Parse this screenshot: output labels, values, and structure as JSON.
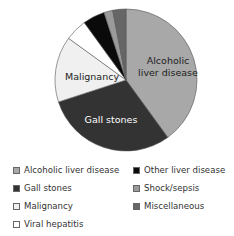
{
  "chart_data": {
    "type": "pie",
    "title": "",
    "categories": [
      "Alcoholic liver disease",
      "Gall stones",
      "Malignancy",
      "Viral hepatitis",
      "Other liver disease",
      "Shock/sepsis",
      "Miscellaneous"
    ],
    "values": [
      40,
      30,
      15,
      5,
      5,
      2,
      3
    ],
    "unit": "percent (estimated)",
    "colors": [
      "#a8a8a8",
      "#333333",
      "#f0f0f0",
      "#ffffff",
      "#0a0a0a",
      "#9a9a9a",
      "#666666"
    ],
    "slice_labels": {
      "Alcoholic liver disease": [
        "Alcoholic",
        "liver disease"
      ],
      "Gall stones": [
        "Gall stones"
      ],
      "Malignancy": [
        "Malignancy"
      ]
    },
    "start_angle_deg": 0,
    "direction": "clockwise",
    "legend_position": "bottom",
    "legend_columns": 2
  },
  "legend": [
    {
      "label": "Alcoholic liver disease",
      "color": "#a8a8a8",
      "x": 13,
      "y": 170
    },
    {
      "label": "Gall stones",
      "color": "#333333",
      "x": 13,
      "y": 188
    },
    {
      "label": "Malignancy",
      "color": "#f0f0f0",
      "x": 13,
      "y": 206
    },
    {
      "label": "Viral hepatitis",
      "color": "#ffffff",
      "x": 13,
      "y": 224
    },
    {
      "label": "Other liver disease",
      "color": "#0a0a0a",
      "x": 133,
      "y": 170
    },
    {
      "label": "Shock/sepsis",
      "color": "#9a9a9a",
      "x": 133,
      "y": 188
    },
    {
      "label": "Miscellaneous",
      "color": "#666666",
      "x": 133,
      "y": 206
    }
  ]
}
